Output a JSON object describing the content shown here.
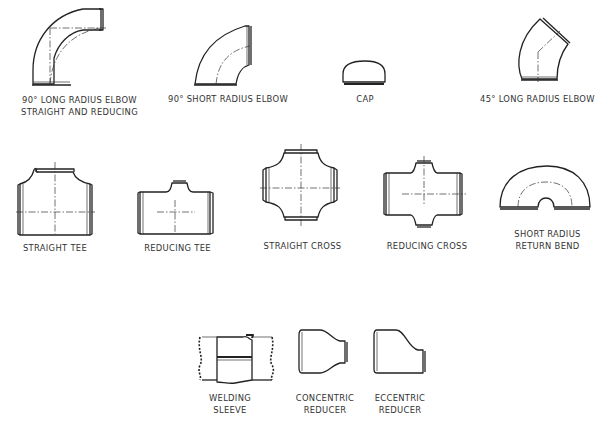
{
  "diagram": {
    "rows": [
      {
        "items": [
          {
            "id": "long-radius-elbow-90",
            "label_line1": "90° LONG RADIUS ELBOW",
            "label_line2": "STRAIGHT AND REDUCING"
          },
          {
            "id": "short-radius-elbow-90",
            "label_line1": "90° SHORT RADIUS ELBOW"
          },
          {
            "id": "cap",
            "label_line1": "CAP"
          },
          {
            "id": "long-radius-elbow-45",
            "label_line1": "45° LONG RADIUS ELBOW"
          }
        ]
      },
      {
        "items": [
          {
            "id": "straight-tee",
            "label_line1": "STRAIGHT TEE"
          },
          {
            "id": "reducing-tee",
            "label_line1": "REDUCING TEE"
          },
          {
            "id": "straight-cross",
            "label_line1": "STRAIGHT CROSS"
          },
          {
            "id": "reducing-cross",
            "label_line1": "REDUCING CROSS"
          },
          {
            "id": "short-radius-return-bend",
            "label_line1": "SHORT RADIUS",
            "label_line2": "RETURN BEND"
          }
        ]
      },
      {
        "items": [
          {
            "id": "welding-sleeve",
            "label_line1": "WELDING",
            "label_line2": "SLEEVE"
          },
          {
            "id": "concentric-reducer",
            "label_line1": "CONCENTRIC",
            "label_line2": "REDUCER"
          },
          {
            "id": "eccentric-reducer",
            "label_line1": "ECCENTRIC",
            "label_line2": "REDUCER"
          }
        ]
      }
    ],
    "colors": {
      "line": "#222222",
      "background": "#ffffff"
    }
  }
}
